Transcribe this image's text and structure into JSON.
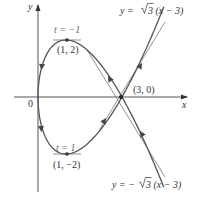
{
  "figure": {
    "type": "parametric-curve",
    "curve": "x = t^2, y = t^3 - 3t",
    "axes": {
      "x_label": "x",
      "y_label": "y",
      "origin_label": "0"
    },
    "points": [
      {
        "label": "(1, 2)",
        "x": 1,
        "y": 2,
        "t_label": "t = −1"
      },
      {
        "label": "(1, −2)",
        "x": 1,
        "y": -2,
        "t_label": "t = 1"
      },
      {
        "label": "(3, 0)",
        "x": 3,
        "y": 0
      }
    ],
    "tangent_lines": [
      {
        "label": "y = √3 (x − 3)",
        "slope": 1.732
      },
      {
        "label": "y = −√3 (x − 3)",
        "slope": -1.732
      }
    ],
    "colors": {
      "curve": "#555555",
      "axes": "#555555",
      "tangent": "#777777",
      "text": "#333333"
    }
  },
  "labels": {
    "y_axis": "y",
    "x_axis": "x",
    "origin": "0",
    "pt_top": "(1, 2)",
    "pt_bottom": "(1, −2)",
    "pt_cross": "(3, 0)",
    "t_top": "t = −1",
    "t_bottom": "t = 1",
    "tan_pos_prefix": "y = ",
    "tan_pos_body": "3 (x − 3)",
    "tan_neg_prefix": "y = −",
    "tan_neg_body": "3 (x − 3)"
  }
}
